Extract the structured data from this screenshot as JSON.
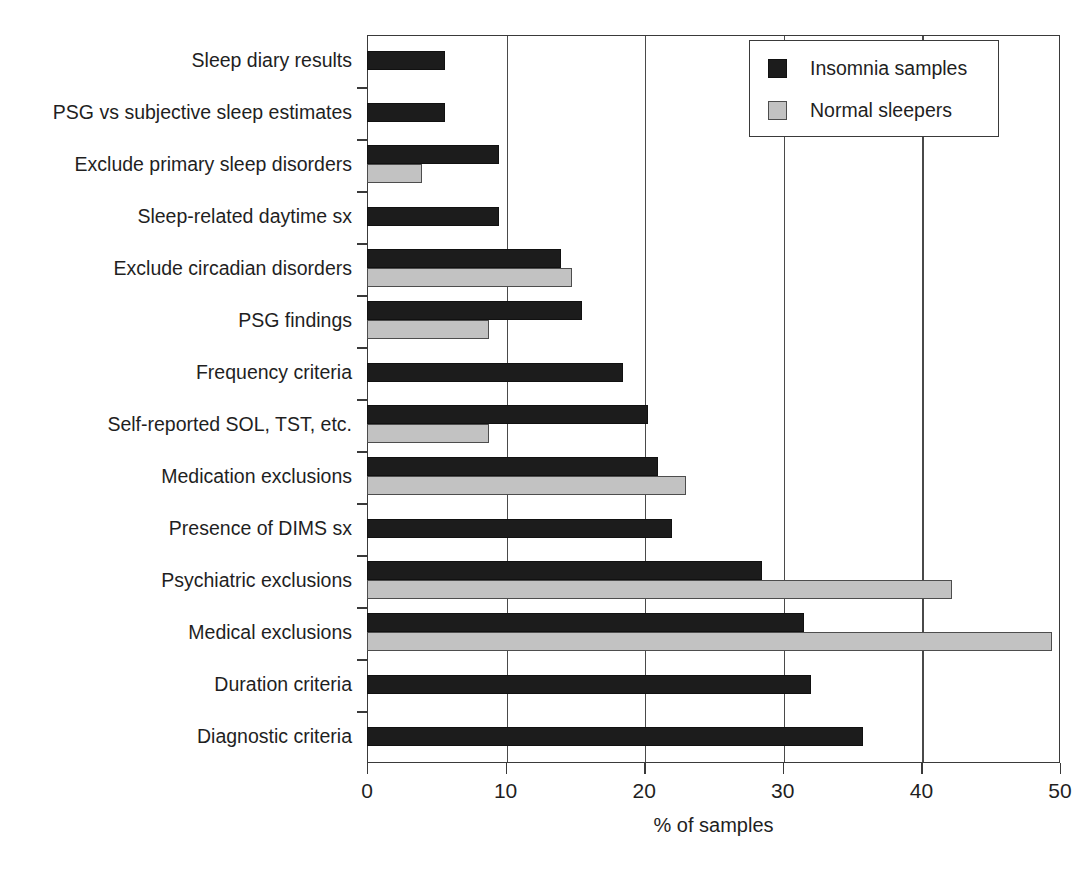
{
  "chart_data": {
    "type": "bar",
    "orientation": "horizontal",
    "title": "",
    "xlabel": "% of samples",
    "ylabel": "",
    "xlim": [
      0,
      50
    ],
    "xticks": [
      0,
      10,
      20,
      30,
      40,
      50
    ],
    "xtick_labels": [
      "0",
      "10",
      "20",
      "30",
      "40",
      "50"
    ],
    "grid": "vertical",
    "legend_position": "top-right",
    "categories": [
      "Sleep diary results",
      "PSG vs subjective sleep estimates",
      "Exclude primary sleep disorders",
      "Sleep-related daytime sx",
      "Exclude circadian disorders",
      "PSG findings",
      "Frequency criteria",
      "Self-reported SOL, TST, etc.",
      "Medication exclusions",
      "Presence of DIMS sx",
      "Psychiatric exclusions",
      "Medical exclusions",
      "Duration criteria",
      "Diagnostic criteria"
    ],
    "series": [
      {
        "name": "Insomnia samples",
        "color": "#1c1c1c",
        "values": [
          5.6,
          5.6,
          9.5,
          9.5,
          14.0,
          15.5,
          18.5,
          20.3,
          21.0,
          22.0,
          28.5,
          31.5,
          32.0,
          35.8
        ]
      },
      {
        "name": "Normal sleepers",
        "color": "#c2c2c2",
        "values": [
          0,
          0,
          4.0,
          0,
          14.8,
          8.8,
          0,
          8.8,
          23.0,
          0,
          42.2,
          49.4,
          0,
          0
        ]
      }
    ]
  },
  "legend": {
    "entries": [
      {
        "label": "Insomnia samples",
        "swatch": "black-square-swatch"
      },
      {
        "label": "Normal sleepers",
        "swatch": "gray-square-swatch"
      }
    ]
  },
  "axis": {
    "x_title": "% of samples"
  }
}
